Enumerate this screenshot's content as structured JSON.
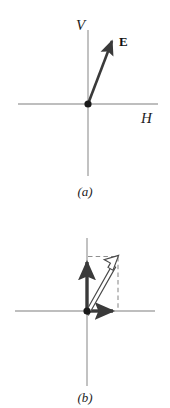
{
  "figure": {
    "background_color": "#ffffff",
    "axis_color": "#a8a8a8",
    "vector_color": "#3a3a3a",
    "outline_vector_fill": "#ffffff",
    "outline_vector_stroke": "#4a4a4a",
    "dashed_color": "#8f8f8f",
    "label_color": "#1c1c1c"
  },
  "panel_a": {
    "caption": "(a)",
    "vertical_axis_label": "V",
    "horizontal_axis_label": "H",
    "vector_label": "E",
    "origin": {
      "x": 88,
      "y": 104
    },
    "vector_tip": {
      "x": 114,
      "y": 36
    }
  },
  "panel_b": {
    "caption": "(b)",
    "origin": {
      "x": 87,
      "y": 311
    },
    "vertical_component_tip": {
      "x": 87,
      "y": 257
    },
    "horizontal_component_tip": {
      "x": 118,
      "y": 311
    },
    "resultant_tip": {
      "x": 118,
      "y": 257
    },
    "dashed_rectangle": {
      "top_y": 257,
      "right_x": 118,
      "origin_x": 87,
      "origin_y": 311
    }
  }
}
